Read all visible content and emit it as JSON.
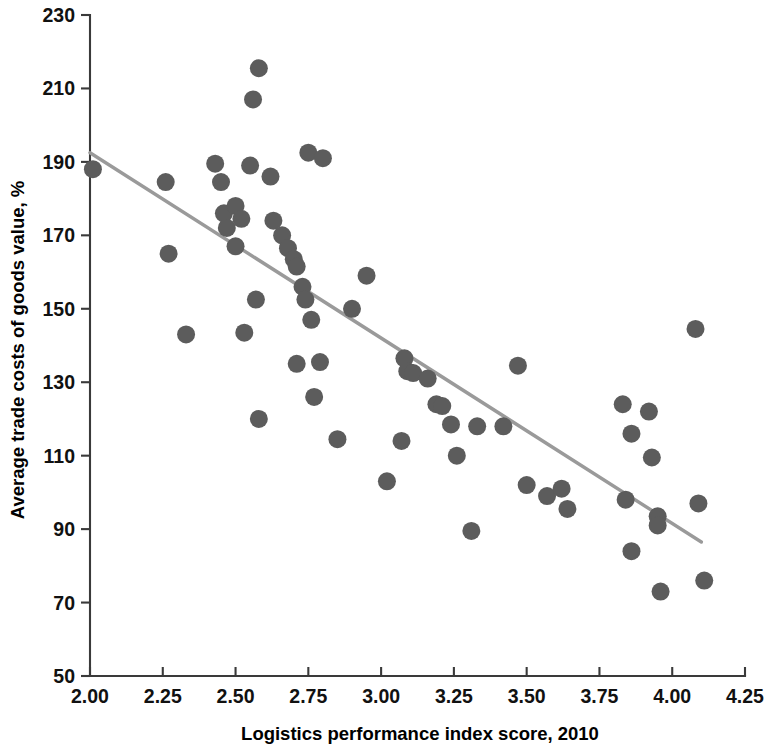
{
  "chart_data": {
    "type": "scatter",
    "title": "",
    "xlabel": "Logistics performance index score, 2010",
    "ylabel": "Average trade costs of goods value, %",
    "xlim": [
      2.0,
      4.25
    ],
    "ylim": [
      50,
      230
    ],
    "xticks": [
      2.0,
      2.25,
      2.5,
      2.75,
      3.0,
      3.25,
      3.5,
      3.75,
      4.0,
      4.25
    ],
    "xticklabels": [
      "2.00",
      "2.25",
      "2.50",
      "2.75",
      "3.00",
      "3.25",
      "3.50",
      "3.75",
      "4.00",
      "4.25"
    ],
    "yticks": [
      50,
      70,
      90,
      110,
      130,
      150,
      170,
      190,
      210,
      230
    ],
    "yticklabels": [
      "50",
      "70",
      "90",
      "110",
      "130",
      "150",
      "170",
      "190",
      "210",
      "230"
    ],
    "grid": false,
    "legend": null,
    "marker_color": "#5c5c5c",
    "marker_size": 9,
    "trendline": {
      "name": "linear fit",
      "color": "#9a9a9a",
      "x_start": 2.0,
      "y_start": 192.5,
      "x_end": 4.1,
      "y_end": 86.5
    },
    "points": [
      {
        "x": 2.01,
        "y": 188.0
      },
      {
        "x": 2.26,
        "y": 184.5
      },
      {
        "x": 2.27,
        "y": 165.0
      },
      {
        "x": 2.33,
        "y": 143.0
      },
      {
        "x": 2.43,
        "y": 189.5
      },
      {
        "x": 2.45,
        "y": 184.5
      },
      {
        "x": 2.46,
        "y": 176.0
      },
      {
        "x": 2.47,
        "y": 172.0
      },
      {
        "x": 2.5,
        "y": 178.0
      },
      {
        "x": 2.5,
        "y": 167.0
      },
      {
        "x": 2.52,
        "y": 174.5
      },
      {
        "x": 2.53,
        "y": 143.5
      },
      {
        "x": 2.55,
        "y": 189.0
      },
      {
        "x": 2.56,
        "y": 207.0
      },
      {
        "x": 2.57,
        "y": 152.5
      },
      {
        "x": 2.58,
        "y": 215.5
      },
      {
        "x": 2.58,
        "y": 120.0
      },
      {
        "x": 2.62,
        "y": 186.0
      },
      {
        "x": 2.63,
        "y": 174.0
      },
      {
        "x": 2.66,
        "y": 170.0
      },
      {
        "x": 2.68,
        "y": 166.5
      },
      {
        "x": 2.7,
        "y": 163.5
      },
      {
        "x": 2.71,
        "y": 161.5
      },
      {
        "x": 2.71,
        "y": 135.0
      },
      {
        "x": 2.73,
        "y": 156.0
      },
      {
        "x": 2.74,
        "y": 152.5
      },
      {
        "x": 2.75,
        "y": 192.5
      },
      {
        "x": 2.76,
        "y": 147.0
      },
      {
        "x": 2.77,
        "y": 126.0
      },
      {
        "x": 2.79,
        "y": 135.5
      },
      {
        "x": 2.8,
        "y": 191.0
      },
      {
        "x": 2.85,
        "y": 114.5
      },
      {
        "x": 2.9,
        "y": 150.0
      },
      {
        "x": 2.95,
        "y": 159.0
      },
      {
        "x": 3.02,
        "y": 103.0
      },
      {
        "x": 3.07,
        "y": 114.0
      },
      {
        "x": 3.08,
        "y": 136.5
      },
      {
        "x": 3.09,
        "y": 133.0
      },
      {
        "x": 3.11,
        "y": 132.5
      },
      {
        "x": 3.16,
        "y": 131.0
      },
      {
        "x": 3.19,
        "y": 124.0
      },
      {
        "x": 3.21,
        "y": 123.5
      },
      {
        "x": 3.24,
        "y": 118.5
      },
      {
        "x": 3.26,
        "y": 110.0
      },
      {
        "x": 3.31,
        "y": 89.5
      },
      {
        "x": 3.33,
        "y": 118.0
      },
      {
        "x": 3.42,
        "y": 118.0
      },
      {
        "x": 3.47,
        "y": 134.5
      },
      {
        "x": 3.5,
        "y": 102.0
      },
      {
        "x": 3.57,
        "y": 99.0
      },
      {
        "x": 3.62,
        "y": 101.0
      },
      {
        "x": 3.64,
        "y": 95.5
      },
      {
        "x": 3.83,
        "y": 124.0
      },
      {
        "x": 3.84,
        "y": 98.0
      },
      {
        "x": 3.86,
        "y": 116.0
      },
      {
        "x": 3.86,
        "y": 84.0
      },
      {
        "x": 3.92,
        "y": 122.0
      },
      {
        "x": 3.93,
        "y": 109.5
      },
      {
        "x": 3.95,
        "y": 93.5
      },
      {
        "x": 3.95,
        "y": 91.0
      },
      {
        "x": 3.96,
        "y": 73.0
      },
      {
        "x": 4.08,
        "y": 144.5
      },
      {
        "x": 4.09,
        "y": 97.0
      },
      {
        "x": 4.11,
        "y": 76.0
      }
    ]
  }
}
